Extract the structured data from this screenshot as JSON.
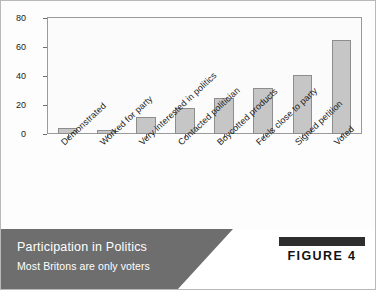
{
  "chart_data": {
    "type": "bar",
    "title": "Participation in Politics",
    "subtitle": "Most Britons are only voters",
    "xlabel": "",
    "ylabel": "Percentage",
    "ylim": [
      0,
      80
    ],
    "yticks": [
      0,
      20,
      40,
      60,
      80
    ],
    "grid": false,
    "legend": "none",
    "categories": [
      "Demonstrated",
      "Worked for party",
      "Very interested in politics",
      "Contacted politician",
      "Boycotted products",
      "Feels close to party",
      "Signed petition",
      "Voted"
    ],
    "values": [
      4,
      3,
      12,
      18,
      25,
      32,
      41,
      65
    ],
    "bar_color": "#c6c6c6",
    "bar_border_color": "#8d8d8d"
  },
  "caption": {
    "title": "Participation in Politics",
    "subtitle": "Most Britons are only voters",
    "figure_label": "FIGURE 4"
  }
}
